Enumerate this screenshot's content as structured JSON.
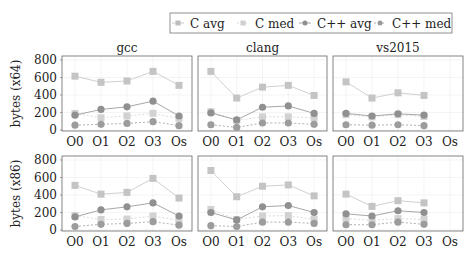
{
  "legend": {
    "entries": [
      {
        "label": "C avg",
        "marker": "square",
        "line": "solid",
        "color": "#bdbdbd"
      },
      {
        "label": "C med",
        "marker": "square",
        "line": "dashed",
        "color": "#cfcfcf"
      },
      {
        "label": "C++ avg",
        "marker": "circle",
        "line": "solid",
        "color": "#8f8f8f"
      },
      {
        "label": "C++ med",
        "marker": "circle",
        "line": "dashed",
        "color": "#9a9a9a"
      }
    ]
  },
  "columns": [
    "gcc",
    "clang",
    "vs2015"
  ],
  "rows": [
    "bytes (x64)",
    "bytes (x86)"
  ],
  "chart_data": [
    {
      "type": "line",
      "title": "gcc",
      "ylabel": "bytes (x64)",
      "categories": [
        "O0",
        "O1",
        "O2",
        "O3",
        "Os"
      ],
      "ylim": [
        0,
        800
      ],
      "yticks": [
        0,
        200,
        400,
        600,
        800
      ],
      "grid": true,
      "series": [
        {
          "name": "C avg",
          "values": [
            615,
            545,
            560,
            670,
            510
          ]
        },
        {
          "name": "C med",
          "values": [
            190,
            140,
            160,
            190,
            130
          ]
        },
        {
          "name": "C++ avg",
          "values": [
            170,
            235,
            265,
            330,
            160
          ]
        },
        {
          "name": "C++ med",
          "values": [
            55,
            65,
            75,
            95,
            50
          ]
        }
      ]
    },
    {
      "type": "line",
      "title": "clang",
      "ylabel": "",
      "categories": [
        "O0",
        "O1",
        "O2",
        "O3",
        "Os"
      ],
      "ylim": [
        0,
        800
      ],
      "grid": true,
      "series": [
        {
          "name": "C avg",
          "values": [
            670,
            365,
            490,
            510,
            395
          ]
        },
        {
          "name": "C med",
          "values": [
            210,
            110,
            150,
            150,
            140
          ]
        },
        {
          "name": "C++ avg",
          "values": [
            195,
            115,
            260,
            275,
            190
          ]
        },
        {
          "name": "C++ med",
          "values": [
            60,
            30,
            80,
            80,
            65
          ]
        }
      ]
    },
    {
      "type": "line",
      "title": "vs2015",
      "ylabel": "",
      "categories": [
        "O0",
        "O1",
        "O2",
        "O3",
        "Os"
      ],
      "ylim": [
        0,
        800
      ],
      "grid": true,
      "series": [
        {
          "name": "C avg",
          "values": [
            550,
            365,
            425,
            395,
            null
          ]
        },
        {
          "name": "C med",
          "values": [
            175,
            150,
            175,
            155,
            null
          ]
        },
        {
          "name": "C++ avg",
          "values": [
            190,
            160,
            185,
            170,
            null
          ]
        },
        {
          "name": "C++ med",
          "values": [
            60,
            55,
            60,
            50,
            null
          ]
        }
      ]
    },
    {
      "type": "line",
      "title": "",
      "ylabel": "bytes (x86)",
      "categories": [
        "O0",
        "O1",
        "O2",
        "O3",
        "Os"
      ],
      "ylim": [
        0,
        800
      ],
      "yticks": [
        0,
        200,
        400,
        600,
        800
      ],
      "grid": true,
      "series": [
        {
          "name": "C avg",
          "values": [
            510,
            410,
            430,
            590,
            365
          ]
        },
        {
          "name": "C med",
          "values": [
            165,
            120,
            125,
            160,
            110
          ]
        },
        {
          "name": "C++ avg",
          "values": [
            150,
            230,
            265,
            310,
            160
          ]
        },
        {
          "name": "C++ med",
          "values": [
            40,
            65,
            75,
            95,
            55
          ]
        }
      ]
    },
    {
      "type": "line",
      "title": "",
      "ylabel": "",
      "categories": [
        "O0",
        "O1",
        "O2",
        "O3",
        "Os"
      ],
      "ylim": [
        0,
        800
      ],
      "grid": true,
      "series": [
        {
          "name": "C avg",
          "values": [
            680,
            380,
            500,
            515,
            390
          ]
        },
        {
          "name": "C med",
          "values": [
            235,
            120,
            160,
            165,
            120
          ]
        },
        {
          "name": "C++ avg",
          "values": [
            200,
            115,
            265,
            280,
            200
          ]
        },
        {
          "name": "C++ med",
          "values": [
            50,
            40,
            90,
            90,
            75
          ]
        }
      ]
    },
    {
      "type": "line",
      "title": "",
      "ylabel": "",
      "categories": [
        "O0",
        "O1",
        "O2",
        "O3",
        "Os"
      ],
      "ylim": [
        0,
        800
      ],
      "grid": true,
      "series": [
        {
          "name": "C avg",
          "values": [
            410,
            270,
            335,
            310,
            null
          ]
        },
        {
          "name": "C med",
          "values": [
            130,
            110,
            130,
            120,
            null
          ]
        },
        {
          "name": "C++ avg",
          "values": [
            185,
            160,
            220,
            200,
            null
          ]
        },
        {
          "name": "C++ med",
          "values": [
            60,
            60,
            90,
            65,
            null
          ]
        }
      ]
    }
  ]
}
